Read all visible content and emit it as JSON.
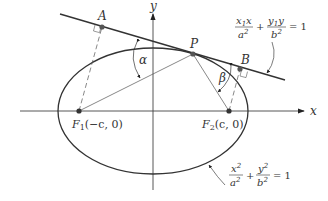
{
  "diagram": {
    "axes": {
      "x_label": "x",
      "y_label": "y"
    },
    "points": {
      "A": "A",
      "B": "B",
      "P": "P",
      "F1": {
        "name": "F",
        "sub": "1",
        "coords": "(−c, 0)"
      },
      "F2": {
        "name": "F",
        "sub": "2",
        "coords": "(c, 0)"
      }
    },
    "angles": {
      "alpha": "α",
      "beta": "β"
    },
    "tangent_equation": {
      "term1_num_a": "x",
      "term1_num_sub": "1",
      "term1_num_b": "x",
      "term1_den": "a",
      "term1_den_exp": "2",
      "plus": "+",
      "term2_num_a": "y",
      "term2_num_sub": "1",
      "term2_num_b": "y",
      "term2_den": "b",
      "term2_den_exp": "2",
      "equals": "= 1"
    },
    "ellipse_equation": {
      "term1_num": "x",
      "term1_num_exp": "2",
      "term1_den": "a",
      "term1_den_exp": "2",
      "plus": "+",
      "term2_num": "y",
      "term2_num_exp": "2",
      "term2_den": "b",
      "term2_den_exp": "2",
      "equals": "= 1"
    },
    "colors": {
      "stroke": "#333333",
      "points": "#555555",
      "background": "#ffffff"
    }
  }
}
